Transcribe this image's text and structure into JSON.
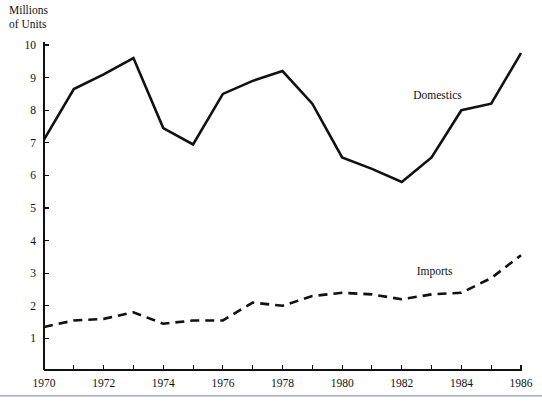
{
  "chart_data": {
    "type": "line",
    "title": "",
    "subtitle": "",
    "xlabel": "",
    "ylabel": "Millions\nof Units",
    "ylabel_line1": "Millions",
    "ylabel_line2": "of Units",
    "x": [
      1970,
      1971,
      1972,
      1973,
      1974,
      1975,
      1976,
      1977,
      1978,
      1979,
      1980,
      1981,
      1982,
      1983,
      1984,
      1985,
      1986
    ],
    "xlim": [
      1970,
      1986
    ],
    "ylim": [
      0,
      10.35
    ],
    "ytick_values": [
      1,
      2,
      3,
      4,
      5,
      6,
      7,
      8,
      9,
      10
    ],
    "ytick_labels": [
      "1",
      "2",
      "3",
      "4",
      "5",
      "6",
      "7",
      "8",
      "9",
      "10"
    ],
    "xtick_values": [
      1970,
      1971,
      1972,
      1973,
      1974,
      1975,
      1976,
      1977,
      1978,
      1979,
      1980,
      1981,
      1982,
      1983,
      1984,
      1985,
      1986
    ],
    "xtick_labels_shown": [
      "1970",
      "1972",
      "1974",
      "1976",
      "1978",
      "1980",
      "1982",
      "1984",
      "1986"
    ],
    "xtick_labeled_values": [
      1970,
      1972,
      1974,
      1976,
      1978,
      1980,
      1982,
      1984,
      1986
    ],
    "grid": false,
    "legend_position": "inline-annotation",
    "series": [
      {
        "name": "Domestics",
        "style": "solid",
        "color": "#111111",
        "label_x": 1983.2,
        "label_y": 8.35,
        "values": [
          7.1,
          8.65,
          9.1,
          9.6,
          7.45,
          6.95,
          8.5,
          8.9,
          9.2,
          8.2,
          6.55,
          6.2,
          5.8,
          6.55,
          8.0,
          8.2,
          9.75
        ]
      },
      {
        "name": "Imports",
        "style": "dashed",
        "color": "#111111",
        "label_x": 1983.1,
        "label_y": 2.95,
        "values": [
          1.35,
          1.55,
          1.6,
          1.8,
          1.45,
          1.55,
          1.55,
          2.1,
          2.0,
          2.3,
          2.4,
          2.35,
          2.2,
          2.35,
          2.4,
          2.85,
          3.55
        ]
      }
    ]
  },
  "colors": {
    "ink": "#111111",
    "background": "#ffffff",
    "footer_rule": "#9aa3bd"
  }
}
